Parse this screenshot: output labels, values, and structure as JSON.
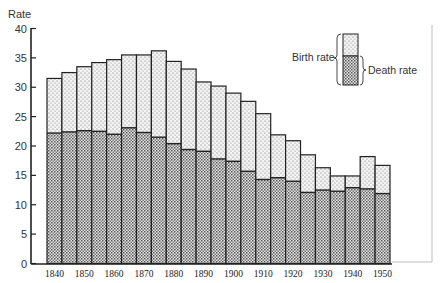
{
  "chart_data": {
    "type": "bar",
    "stacked": true,
    "title": "",
    "xlabel": "",
    "ylabel": "Rate",
    "ylim": [
      0,
      40
    ],
    "yticks": [
      0,
      5,
      10,
      15,
      20,
      25,
      30,
      35,
      40
    ],
    "xtick_labels": [
      "1840",
      "1850",
      "1860",
      "1870",
      "1880",
      "1890",
      "1900",
      "1910",
      "1920",
      "1930",
      "1940",
      "1950"
    ],
    "categories": [
      1840,
      1845,
      1850,
      1855,
      1860,
      1865,
      1870,
      1875,
      1880,
      1885,
      1890,
      1895,
      1900,
      1905,
      1910,
      1915,
      1920,
      1925,
      1930,
      1935,
      1940,
      1945,
      1950
    ],
    "series": [
      {
        "name": "Death rate",
        "pattern": "crosshatch",
        "values": [
          22.2,
          22.4,
          22.6,
          22.5,
          22.0,
          23.1,
          22.3,
          21.5,
          20.4,
          19.4,
          19.1,
          17.8,
          17.4,
          15.7,
          14.3,
          14.6,
          14.0,
          12.1,
          12.5,
          12.3,
          12.9,
          12.7,
          11.9
        ]
      },
      {
        "name": "Birth rate",
        "pattern": "stipple",
        "values": [
          31.5,
          32.5,
          33.5,
          34.2,
          34.7,
          35.5,
          35.5,
          36.2,
          34.4,
          33.1,
          30.9,
          30.2,
          29.0,
          27.6,
          25.5,
          21.9,
          20.9,
          18.5,
          16.3,
          14.9,
          14.9,
          18.2,
          16.7
        ]
      }
    ],
    "legend": {
      "position": "top-right",
      "entries": [
        {
          "label": "Birth rate",
          "series": "Birth rate"
        },
        {
          "label": "Death rate",
          "series": "Death rate"
        }
      ]
    },
    "grid": false
  }
}
